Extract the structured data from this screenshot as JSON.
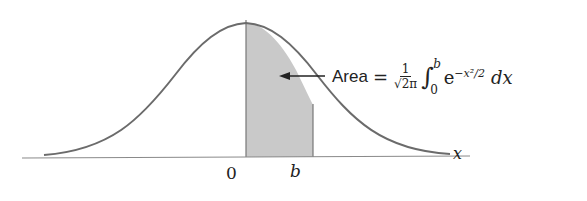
{
  "diagram": {
    "type": "standard-normal-curve-shaded-area",
    "curve": "standard normal density",
    "shaded_region": {
      "from": "0",
      "to": "b"
    },
    "colors": {
      "curve": "#6b6b6b",
      "shade": "#c8c8c8",
      "axis": "#888888",
      "text": "#222222"
    }
  },
  "labels": {
    "x_axis": "x",
    "tick_zero": "0",
    "tick_b": "b"
  },
  "formula": {
    "word": "Area",
    "equals": "=",
    "numerator": "1",
    "denominator": "√2π",
    "integral_sign": "∫",
    "upper_limit": "b",
    "lower_limit": "0",
    "base": "e",
    "exponent": "−x²/2",
    "differential": "dx"
  }
}
